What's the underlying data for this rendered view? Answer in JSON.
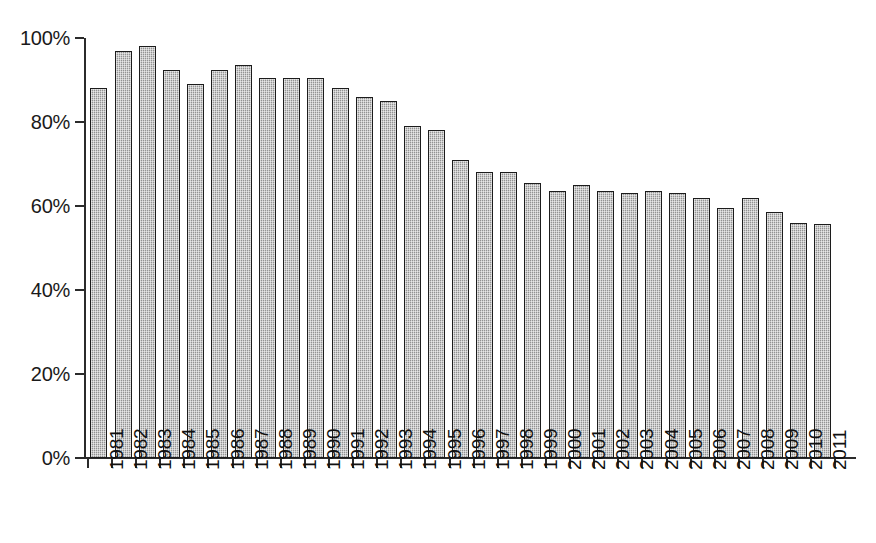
{
  "chart_data": {
    "type": "bar",
    "title": "",
    "subtitle": "",
    "xlabel": "",
    "ylabel": "",
    "categories": [
      "1981",
      "1982",
      "1983",
      "1984",
      "1985",
      "1986",
      "1987",
      "1988",
      "1989",
      "1990",
      "1991",
      "1992",
      "1993",
      "1994",
      "1995",
      "1996",
      "1997",
      "1998",
      "1999",
      "2000",
      "2001",
      "2002",
      "2003",
      "2004",
      "2005",
      "2006",
      "2007",
      "2008",
      "2009",
      "2010",
      "2011"
    ],
    "values": [
      88,
      97,
      98,
      92.5,
      89,
      92.5,
      93.5,
      90.5,
      90.5,
      90.5,
      88,
      86,
      85,
      79,
      78,
      71,
      68,
      68,
      65.5,
      63.5,
      65,
      63.5,
      63,
      63.5,
      63,
      62,
      59.5,
      62,
      58.5,
      56,
      55.8
    ],
    "value_suffix": "%",
    "ylim": [
      0,
      100
    ],
    "ytick_values": [
      0,
      20,
      40,
      60,
      80,
      100
    ],
    "ytick_labels": [
      "0%",
      "20%",
      "40%",
      "60%",
      "80%",
      "100%"
    ],
    "grid": false,
    "legend": null,
    "legend_position": "none",
    "annotations": [],
    "bar_fill_color": "#b4b4b4",
    "bar_edge_color": "#1c1c1c",
    "axis_color": "#2b2b2b",
    "background_color": "#ffffff"
  }
}
